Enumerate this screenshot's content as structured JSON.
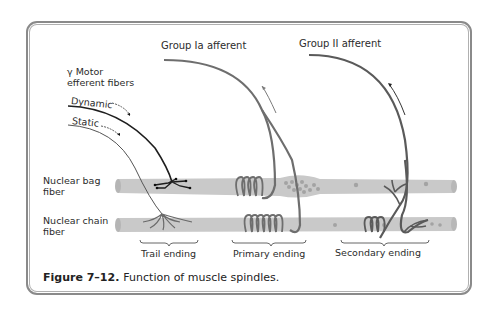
{
  "figure": {
    "caption_number": "Figure 7–12.",
    "caption_text": "Function of muscle spindles."
  },
  "labels": {
    "group_ia": "Group Ia afferent",
    "group_ii": "Group II afferent",
    "gamma_motor_line1": "γ Motor",
    "gamma_motor_line2": "efferent fibers",
    "dynamic": "Dynamic",
    "static": "Static",
    "nuclear_bag_line1": "Nuclear bag",
    "nuclear_bag_line2": "fiber",
    "nuclear_chain_line1": "Nuclear chain",
    "nuclear_chain_line2": "fiber",
    "trail_ending": "Trail ending",
    "primary_ending": "Primary ending",
    "secondary_ending": "Secondary ending"
  },
  "colors": {
    "fiber_fill": "#c9c9c9",
    "nerve_gray": "#6e6e6e",
    "nerve_dark": "#1e1e1e",
    "frame": "#8a8a8a"
  }
}
